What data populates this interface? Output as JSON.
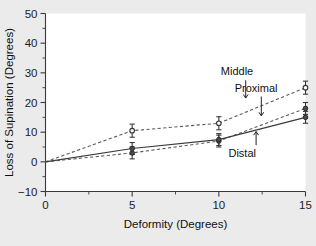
{
  "chart_data": {
    "type": "line",
    "title": "",
    "xlabel": "Deformity (Degrees)",
    "ylabel": "Loss of Supination (Degrees)",
    "xlim": [
      0,
      15
    ],
    "ylim": [
      -10,
      50
    ],
    "x_ticks": [
      "0",
      "5",
      "10",
      "15"
    ],
    "x_tick_values": [
      0,
      5,
      10,
      15
    ],
    "x_minor_ticks": [
      2.5,
      7.5,
      12.5
    ],
    "y_ticks": [
      "50",
      "40",
      "30",
      "20",
      "10",
      "0",
      "−10"
    ],
    "y_tick_values": [
      50,
      40,
      30,
      20,
      10,
      0,
      -10
    ],
    "y_minor_ticks": [
      45,
      35,
      25,
      15,
      5,
      -5
    ],
    "grid": false,
    "legend_position": "inline-annotations",
    "x": [
      0,
      5,
      10,
      15
    ],
    "series": [
      {
        "name": "Middle",
        "style": "dashed",
        "marker": "open-circle",
        "values": [
          0,
          10.5,
          13,
          25
        ],
        "errors": [
          0,
          2.2,
          2.2,
          2.2
        ]
      },
      {
        "name": "Proximal",
        "style": "dashed",
        "marker": "filled-circle",
        "values": [
          0,
          3,
          7,
          18
        ],
        "errors": [
          0,
          2.0,
          2.0,
          2.0
        ]
      },
      {
        "name": "Distal",
        "style": "solid",
        "marker": "filled-circle",
        "values": [
          0,
          4.5,
          7.5,
          15
        ],
        "errors": [
          0,
          2.0,
          2.0,
          2.0
        ]
      }
    ],
    "annotations": [
      {
        "text": "Middle",
        "label_x": 11.05,
        "label_y": 30.5,
        "arrow_x": 11.55,
        "arrow_y0": 27.5,
        "arrow_y1": 21.5
      },
      {
        "text": "Proximal",
        "label_x": 12.15,
        "label_y": 25.0,
        "arrow_x": 12.45,
        "arrow_y0": 22.0,
        "arrow_y1": 15.5
      },
      {
        "text": "Distal",
        "label_x": 11.35,
        "label_y": 3.0,
        "arrow_x": 12.15,
        "arrow_y0": 5.6,
        "arrow_y1": 10.2
      }
    ],
    "colors": {
      "background": "#ebebeb",
      "plot_area": "#ffffff",
      "axis": "#3a3a3a",
      "dashed_series": "#5c5c5c",
      "solid_series": "#3a3a3a",
      "text": "#111111"
    }
  }
}
